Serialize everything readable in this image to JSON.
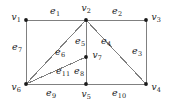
{
  "figure": {
    "type": "undirected-graph-diagram",
    "width": 169,
    "height": 102,
    "background_color": "#ffffff",
    "edge_color": "#808080",
    "vertex_color": "#1a1a1a",
    "label_color": "#1a1a1a"
  },
  "chart_data": {
    "type": "diagram",
    "title": "",
    "vertex_count": 7,
    "edge_count": 11,
    "vertices": [
      {
        "id": "v1",
        "label": "v",
        "sub": "1",
        "x": 26,
        "y": 20,
        "label_x": 16,
        "label_y": 17
      },
      {
        "id": "v2",
        "label": "v",
        "sub": "2",
        "x": 86,
        "y": 20,
        "label_x": 86,
        "label_y": 8
      },
      {
        "id": "v3",
        "label": "v",
        "sub": "3",
        "x": 146,
        "y": 20,
        "label_x": 156,
        "label_y": 17
      },
      {
        "id": "v4",
        "label": "v",
        "sub": "4",
        "x": 146,
        "y": 84,
        "label_x": 156,
        "label_y": 87
      },
      {
        "id": "v5",
        "label": "v",
        "sub": "5",
        "x": 86,
        "y": 84,
        "label_x": 86,
        "label_y": 94
      },
      {
        "id": "v6",
        "label": "v",
        "sub": "6",
        "x": 26,
        "y": 84,
        "label_x": 16,
        "label_y": 87
      },
      {
        "id": "v7",
        "label": "v",
        "sub": "7",
        "x": 86,
        "y": 57,
        "label_x": 97,
        "label_y": 55
      }
    ],
    "edges": [
      {
        "id": "e1",
        "label": "e",
        "sub": "1",
        "from": "v1",
        "to": "v2",
        "label_x": 55,
        "label_y": 11
      },
      {
        "id": "e2",
        "label": "e",
        "sub": "2",
        "from": "v2",
        "to": "v3",
        "label_x": 117,
        "label_y": 11
      },
      {
        "id": "e3",
        "label": "e",
        "sub": "3",
        "from": "v3",
        "to": "v4",
        "label_x": 137,
        "label_y": 51
      },
      {
        "id": "e4",
        "label": "e",
        "sub": "4",
        "from": "v2",
        "to": "v4",
        "label_x": 106,
        "label_y": 41
      },
      {
        "id": "e5",
        "label": "e",
        "sub": "5",
        "from": "v2",
        "to": "v7",
        "label_x": 80,
        "label_y": 41
      },
      {
        "id": "e6",
        "label": "e",
        "sub": "6",
        "from": "v2",
        "to": "v6",
        "label_x": 60,
        "label_y": 52
      },
      {
        "id": "e7",
        "label": "e",
        "sub": "7",
        "from": "v1",
        "to": "v6",
        "label_x": 17,
        "label_y": 47
      },
      {
        "id": "e8",
        "label": "e",
        "sub": "8",
        "from": "v7",
        "to": "v5",
        "label_x": 79,
        "label_y": 71
      },
      {
        "id": "e9",
        "label": "e",
        "sub": "9",
        "from": "v6",
        "to": "v5",
        "label_x": 51,
        "label_y": 93
      },
      {
        "id": "e10",
        "label": "e",
        "sub": "10",
        "from": "v5",
        "to": "v4",
        "label_x": 119,
        "label_y": 93
      },
      {
        "id": "e11",
        "label": "e",
        "sub": "11",
        "from": "v6",
        "to": "v7",
        "label_x": 63,
        "label_y": 71
      }
    ]
  }
}
